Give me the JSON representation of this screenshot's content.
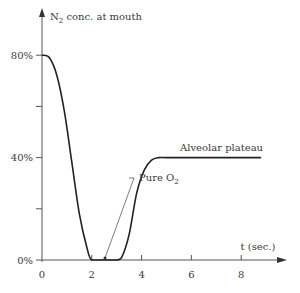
{
  "chart_data": {
    "type": "line",
    "title": "",
    "ylabel": "N2 conc. at mouth",
    "ylabel_main": "N",
    "ylabel_sub": "2",
    "ylabel_rest": " conc. at mouth",
    "xlabel": "t (sec.)",
    "xlim": [
      0,
      9
    ],
    "ylim": [
      0,
      80
    ],
    "x_ticks": [
      0,
      2,
      4,
      6,
      8
    ],
    "x_tick_labels": [
      "0",
      "2",
      "4",
      "6",
      "8"
    ],
    "y_ticks": [
      0,
      20,
      40,
      60,
      80
    ],
    "y_tick_labels": [
      "0%",
      "",
      "40%",
      "",
      "80%"
    ],
    "grid": false,
    "legend": null,
    "series": [
      {
        "name": "N2 concentration",
        "x": [
          0,
          0.3,
          0.6,
          0.9,
          1.2,
          1.5,
          1.8,
          2.0,
          2.5,
          3.0,
          3.2,
          3.5,
          3.8,
          4.1,
          4.4,
          4.7,
          5.0,
          6.0,
          7.0,
          8.0,
          8.8
        ],
        "y": [
          80,
          79,
          72,
          58,
          38,
          18,
          5,
          0,
          0,
          0,
          1,
          10,
          26,
          35,
          39,
          40,
          40,
          40,
          40,
          40,
          40
        ]
      }
    ],
    "annotations": [
      {
        "text": "Pure O",
        "sub": "2",
        "points_to": {
          "x": 2.5,
          "y": 0
        }
      },
      {
        "text": "Alveolar plateau",
        "region": {
          "x_start": 5,
          "x_end": 8.8,
          "y": 40
        }
      }
    ]
  }
}
